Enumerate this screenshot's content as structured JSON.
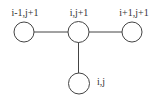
{
  "diagram": {
    "type": "stencil-graph",
    "colors": {
      "stroke": "#444444",
      "text": "#333333",
      "background": "#ffffff"
    },
    "nodes": [
      {
        "id": "n_im1_jp1",
        "label": "i-1,j+1"
      },
      {
        "id": "n_i_jp1",
        "label": "i,j+1"
      },
      {
        "id": "n_ip1_jp1",
        "label": "i+1,j+1"
      },
      {
        "id": "n_i_j",
        "label": "i,j"
      }
    ],
    "edges": [
      {
        "from": "i-1,j+1",
        "to": "i,j+1"
      },
      {
        "from": "i,j+1",
        "to": "i+1,j+1"
      },
      {
        "from": "i,j+1",
        "to": "i,j"
      }
    ]
  }
}
